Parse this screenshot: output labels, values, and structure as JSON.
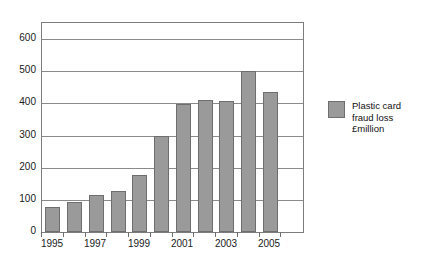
{
  "chart_data": {
    "type": "bar",
    "title": "Plastic card fraud losses on UK-issued cards",
    "xlabel": "",
    "ylabel": "",
    "ylim": [
      0,
      650
    ],
    "yticks": [
      0,
      100,
      200,
      300,
      400,
      500,
      600
    ],
    "ytick_labels": [
      "0",
      "100",
      "200",
      "300",
      "400",
      "500",
      "600"
    ],
    "grid": true,
    "legend_position": "right",
    "categories": [
      "1995",
      "1996",
      "1997",
      "1998",
      "1999",
      "2000",
      "2001",
      "2002",
      "2003",
      "2004",
      "2005"
    ],
    "xtick_labels": [
      "1995",
      "",
      "1997",
      "",
      "1999",
      "",
      "2001",
      "",
      "2003",
      "",
      "2005"
    ],
    "series": [
      {
        "name": "Plastic card\nfraud loss\n£million",
        "color": "#9a9a9a",
        "values": [
          78,
          92,
          115,
          128,
          178,
          300,
          397,
          412,
          408,
          500,
          435
        ]
      }
    ]
  },
  "legend": {
    "label": "Plastic card\nfraud loss\n£million",
    "swatch_color": "#9a9a9a"
  },
  "axis_colors": {
    "frame": "#7d7d7d",
    "gridline": "#8a8a8a",
    "text": "#1a1a1a"
  }
}
